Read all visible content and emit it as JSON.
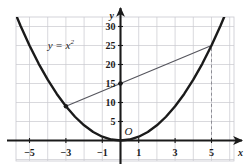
{
  "figure": {
    "name": "parabola-secant-line-graph",
    "background_color": "#ffffff"
  },
  "chart_data": {
    "type": "line",
    "title": "",
    "xlabel": "x",
    "ylabel": "y",
    "origin_label": "O",
    "grid": true,
    "grid_color": "#c9c9cf",
    "axis_color": "#1a1a1a",
    "xlim": [
      -6.2,
      6.2
    ],
    "ylim": [
      -2.5,
      37
    ],
    "x_ticks": [
      -5,
      -3,
      -1,
      1,
      3,
      5
    ],
    "x_tick_labels": [
      "−5",
      "−3",
      "−1",
      "1",
      "3",
      "5"
    ],
    "y_ticks": [
      5,
      10,
      15,
      20,
      25,
      30
    ],
    "y_tick_labels": [
      "5",
      "10",
      "15",
      "20",
      "25",
      "30"
    ],
    "x_grid_step": 1,
    "y_grid_step": 5,
    "series": [
      {
        "name": "parabola",
        "label": "y = x²",
        "equation": "y = x^2",
        "color": "#1a1a1a",
        "width": 2.4,
        "arrow_start": true,
        "arrow_end": true,
        "x": [
          -6.05,
          -5.5,
          -5,
          -4.5,
          -4,
          -3.5,
          -3,
          -2.5,
          -2,
          -1.5,
          -1,
          -0.5,
          0,
          0.5,
          1,
          1.5,
          2,
          2.5,
          3,
          3.5,
          4,
          4.5,
          5,
          5.5,
          6.05
        ],
        "y": [
          36.6,
          30.25,
          25,
          20.25,
          16,
          12.25,
          9,
          6.25,
          4,
          2.25,
          1,
          0.25,
          0,
          0.25,
          1,
          2.25,
          4,
          6.25,
          9,
          12.25,
          16,
          20.25,
          25,
          30.25,
          36.6
        ]
      },
      {
        "name": "secant-line",
        "equation": "y = 2x + 15",
        "color": "#55555d",
        "width": 1.1,
        "x": [
          -3,
          5
        ],
        "y": [
          9,
          25
        ]
      }
    ],
    "points": [
      {
        "name": "point-left-intersection",
        "x": -3,
        "y": 9,
        "color": "#1a1a1a",
        "radius": 2.2
      },
      {
        "name": "point-y-intercept",
        "x": 0,
        "y": 15,
        "color": "#1a1a1a",
        "radius": 2.2
      }
    ],
    "dashed_lines": [
      {
        "name": "dashed-vertical-at-x5",
        "x": 5,
        "y_from": 0,
        "y_to": 25,
        "color": "#8d8d95",
        "dash": "3 2.6"
      }
    ],
    "annotations": [
      {
        "name": "curve-equation-label",
        "text": "y = x",
        "superscript": "2",
        "x": -4.0,
        "y": 26.5
      }
    ]
  }
}
